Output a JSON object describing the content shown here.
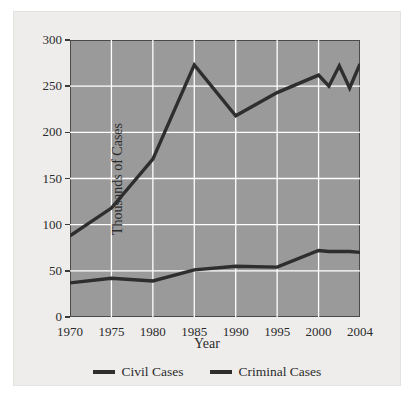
{
  "chart_data": {
    "type": "line",
    "title": "",
    "xlabel": "Year",
    "ylabel": "Thousands of Cases",
    "xlim": [
      1970,
      2004
    ],
    "ylim": [
      0,
      300
    ],
    "grid": true,
    "legend_position": "bottom",
    "background_color": "#9a9a9a",
    "gridline_color": "#ffffff",
    "line_color": "#2e2e2e",
    "x_ticks": [
      1970,
      1975,
      1980,
      1985,
      1990,
      1995,
      2000,
      2004
    ],
    "x_tick_labels": [
      "1970",
      "1975",
      "1980",
      "1985",
      "1990",
      "1995",
      "2000",
      "2004"
    ],
    "y_ticks": [
      0,
      50,
      100,
      150,
      200,
      250,
      300
    ],
    "y_tick_labels": [
      "0",
      "50",
      "100",
      "150",
      "200",
      "250",
      "300"
    ],
    "x": [
      1970,
      1975,
      1980,
      1985,
      1990,
      1995,
      2000,
      2001,
      2002,
      2003,
      2004
    ],
    "series": [
      {
        "name": "Civil Cases",
        "values": [
          37,
          42,
          39,
          51,
          55,
          54,
          72,
          71,
          71,
          71,
          70
        ]
      },
      {
        "name": "Criminal Cases",
        "values": [
          88,
          118,
          171,
          273,
          218,
          243,
          262,
          250,
          272,
          248,
          274
        ]
      }
    ]
  },
  "legend": {
    "items": [
      {
        "label": "Civil Cases",
        "color": "#2e2e2e"
      },
      {
        "label": "Criminal Cases",
        "color": "#2e2e2e"
      }
    ]
  },
  "axes": {
    "x_title": "Year",
    "y_title": "Thousands of Cases"
  }
}
